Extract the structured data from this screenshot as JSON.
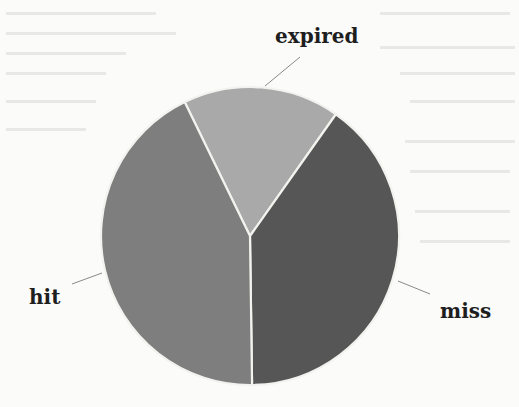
{
  "chart_data": {
    "type": "pie",
    "title": "",
    "categories": [
      "expired",
      "miss",
      "hit"
    ],
    "values": [
      17,
      40,
      43
    ],
    "unit": "percent (estimated from slice angles)",
    "colors": [
      "#a9a9a9",
      "#565656",
      "#7e7e7e"
    ],
    "start_angle_deg": -26,
    "direction": "clockwise",
    "legend": "none",
    "labels_outside_with_leader_lines": true
  },
  "labels": {
    "expired": "expired",
    "miss": "miss",
    "hit": "hit"
  },
  "style": {
    "background": "#fbfbfa",
    "separator": "#f2f2ee",
    "text": "#1e1e1e",
    "leader": "#8a8a8a"
  }
}
